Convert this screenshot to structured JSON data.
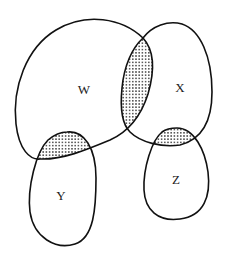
{
  "diagram": {
    "type": "venn",
    "sets": [
      {
        "id": "W",
        "label": "W"
      },
      {
        "id": "X",
        "label": "X"
      },
      {
        "id": "Y",
        "label": "Y"
      },
      {
        "id": "Z",
        "label": "Z"
      }
    ],
    "shaded_intersections": [
      {
        "sets": [
          "W",
          "X"
        ]
      },
      {
        "sets": [
          "W",
          "Y"
        ]
      },
      {
        "sets": [
          "X",
          "Z"
        ]
      }
    ],
    "colors": {
      "outline": "#111111",
      "shading_dot": "#333333",
      "background": "#ffffff"
    }
  }
}
